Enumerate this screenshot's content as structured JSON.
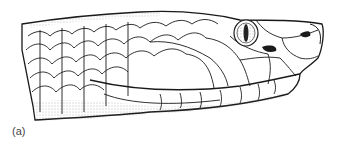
{
  "figure": {
    "panel_label": "(a)",
    "colors": {
      "ink": "#1a1a1a",
      "background": "#ffffff",
      "stipple": "#777777"
    }
  }
}
